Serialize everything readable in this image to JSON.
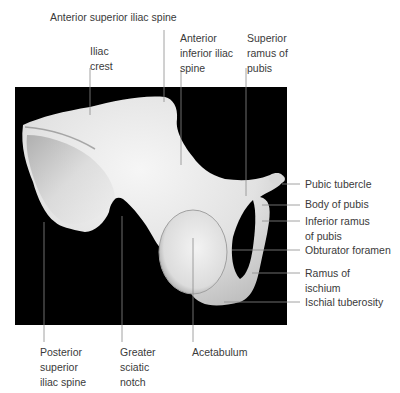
{
  "figure": {
    "background": "#000000",
    "bone_color": "#eeeeee"
  },
  "labels": {
    "top": [
      {
        "id": "anterior-superior-iliac-spine",
        "lines": [
          "Anterior superior iliac spine"
        ]
      },
      {
        "id": "iliac-crest",
        "lines": [
          "Iliac",
          "crest"
        ]
      },
      {
        "id": "anterior-inferior-iliac-spine",
        "lines": [
          "Anterior",
          "inferior iliac",
          "spine"
        ]
      },
      {
        "id": "superior-ramus-of-pubis",
        "lines": [
          "Superior",
          "ramus of",
          "pubis"
        ]
      }
    ],
    "right": [
      {
        "id": "pubic-tubercle",
        "lines": [
          "Pubic tubercle"
        ]
      },
      {
        "id": "body-of-pubis",
        "lines": [
          "Body of pubis"
        ]
      },
      {
        "id": "inferior-ramus-of-pubis",
        "lines": [
          "Inferior ramus",
          "of pubis"
        ]
      },
      {
        "id": "obturator-foramen",
        "lines": [
          "Obturator foramen"
        ]
      },
      {
        "id": "ramus-of-ischium",
        "lines": [
          "Ramus of",
          "ischium"
        ]
      },
      {
        "id": "ischial-tuberosity",
        "lines": [
          "Ischial tuberosity"
        ]
      }
    ],
    "bottom": [
      {
        "id": "posterior-superior-iliac-spine",
        "lines": [
          "Posterior",
          "superior",
          "iliac spine"
        ]
      },
      {
        "id": "greater-sciatic-notch",
        "lines": [
          "Greater",
          "sciatic",
          "notch"
        ]
      },
      {
        "id": "acetabulum",
        "lines": [
          "Acetabulum"
        ]
      }
    ]
  }
}
